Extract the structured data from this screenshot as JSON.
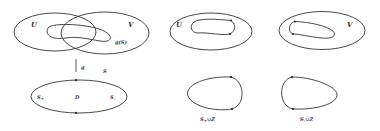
{
  "panels": {
    "left": {
      "top_labels": {
        "U": "U",
        "V": "V",
        "gS": "g(S)"
      },
      "map_label": "g",
      "curve_label": "S",
      "disk_labels": {
        "S_plus": "S",
        "S_plus_sub": "+",
        "D": "D",
        "S_minus": "S",
        "S_minus_sub": "-"
      }
    },
    "middle": {
      "top_label": "U",
      "bottom_label": {
        "main": "S",
        "sub": "+",
        "rest": "∪Z"
      }
    },
    "right": {
      "top_label": "V",
      "bottom_label": {
        "main": "S",
        "sub": "-",
        "rest": "∪Z"
      }
    }
  }
}
